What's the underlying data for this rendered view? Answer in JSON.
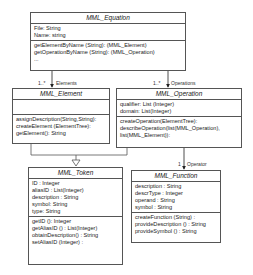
{
  "classes": {
    "equation": {
      "name": "MML_Equation",
      "attributes": [
        "File: String",
        "Name: string"
      ],
      "methods": [
        "getElementByName (String): (MML_Element)",
        "getOperationByName (String): (MML_Operation)",
        "..."
      ]
    },
    "element": {
      "name": "MML_Element",
      "attributes": [],
      "methods": [
        "assignDescription(String,String):",
        "createElement (ElementTree):",
        "getElement(): String"
      ]
    },
    "operation": {
      "name": "MML_Operation",
      "attributes": [
        "qualifier: List (Integer)",
        "domain: List(Integer)"
      ],
      "methods": [
        "createOperation(ElementTree):",
        "describeOperation(list(MML_Operation),",
        "list(MML_Element)):"
      ]
    },
    "token": {
      "name": "MML_Token",
      "attributes": [
        "ID : Integer",
        "aliasID : List(Integer)",
        "description : String",
        "symbol: String",
        "type: String"
      ],
      "methods": [
        "getID (): Integer",
        "getAliasID () : List(Integer)",
        "obtainDescription() : String",
        "setAliasID (Integer) :"
      ]
    },
    "function": {
      "name": "MML_Function",
      "attributes": [
        "description : String",
        "descrType : Integer",
        "operand : String",
        "symbol : String"
      ],
      "methods": [
        "createFunction (String) :",
        "provideDescription () : String",
        "provideSymbol () : String"
      ]
    }
  },
  "associations": {
    "elements": {
      "multiplicity": "1..*",
      "role": "Elements"
    },
    "operations": {
      "multiplicity": "1..*",
      "role": "Operations"
    },
    "operator": {
      "multiplicity": "1",
      "role": "Operator"
    }
  }
}
